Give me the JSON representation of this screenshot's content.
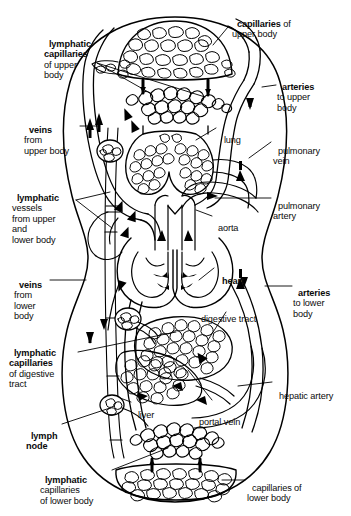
{
  "diagram": {
    "type": "anatomical-line-diagram",
    "style": {
      "stroke": "#000000",
      "fill": "#ffffff",
      "background": "#ffffff",
      "text_color": "#0b0b0b"
    },
    "labels": [
      {
        "id": "capillaries-upper-body",
        "bold": "capillaries",
        "rest": " of\nupper body",
        "x": 232,
        "y": 8,
        "align": "left"
      },
      {
        "id": "lymphatic-capillaries-upper-body",
        "bold": "lymphatic\ncapillaries",
        "rest": "\nof upper\nbody",
        "x": 44,
        "y": 28,
        "align": "left"
      },
      {
        "id": "arteries-to-upper-body",
        "bold": "arteries",
        "rest": "\nto upper\nbody",
        "x": 277,
        "y": 71,
        "align": "left"
      },
      {
        "id": "veins-from-upper-body",
        "bold": "veins",
        "rest": "\nfrom\nupper body",
        "x": 24,
        "y": 114,
        "align": "left"
      },
      {
        "id": "lung",
        "bold": "",
        "rest": "lung",
        "x": 219,
        "y": 124,
        "align": "left"
      },
      {
        "id": "pulmonary-vein",
        "bold": "",
        "rest": "pulmonary\nvein",
        "x": 273,
        "y": 135,
        "align": "left"
      },
      {
        "id": "lymphatic-vessels-upper-lower-body",
        "bold": "lymphatic",
        "rest": "\nvessels\nfrom upper\nand\nlower body",
        "x": 12,
        "y": 182,
        "align": "left"
      },
      {
        "id": "pulmonary-artery",
        "bold": "",
        "rest": "pulmonary\nartery",
        "x": 273,
        "y": 190,
        "align": "left"
      },
      {
        "id": "aorta",
        "bold": "",
        "rest": "aorta",
        "x": 213,
        "y": 212,
        "align": "left"
      },
      {
        "id": "heart",
        "bold": "heart",
        "rest": "",
        "x": 217,
        "y": 265,
        "align": "left"
      },
      {
        "id": "veins-from-lower-body",
        "bold": "veins",
        "rest": "\nfrom\nlower\nbody",
        "x": 14,
        "y": 269,
        "align": "left"
      },
      {
        "id": "arteries-to-lower-body",
        "bold": "arteries",
        "rest": "\nto lower\nbody",
        "x": 293,
        "y": 277,
        "align": "left"
      },
      {
        "id": "digestive-tract",
        "bold": "",
        "rest": "digestive tract",
        "x": 196,
        "y": 303,
        "align": "left"
      },
      {
        "id": "lymphatic-capillaries-digestive-tract",
        "bold": "lymphatic\ncapillaries",
        "rest": "\nof digestive\ntract",
        "x": 9,
        "y": 337,
        "align": "left"
      },
      {
        "id": "hepatic-artery",
        "bold": "",
        "rest": "hepatic artery",
        "x": 274,
        "y": 380,
        "align": "left"
      },
      {
        "id": "liver",
        "bold": "",
        "rest": "liver",
        "x": 133,
        "y": 399,
        "align": "left"
      },
      {
        "id": "portal-vein",
        "bold": "",
        "rest": "portal vein",
        "x": 194,
        "y": 406,
        "align": "left"
      },
      {
        "id": "lymph-node",
        "bold": "lymph\nnode",
        "rest": "",
        "x": 26,
        "y": 420,
        "align": "left"
      },
      {
        "id": "lymphatic-capillaries-lower-body",
        "bold": "lymphatic",
        "rest": "\ncapillaries\nof lower body",
        "x": 40,
        "y": 464,
        "align": "left"
      },
      {
        "id": "capillaries-of-lower-body",
        "bold": "",
        "rest": "capillaries of\nlower body",
        "x": 247,
        "y": 472,
        "align": "left"
      }
    ],
    "structures": [
      "body-outline",
      "capillary-bed-upper-body",
      "lymphatic-capillary-plexus-upper",
      "lung",
      "heart",
      "aorta",
      "pulmonary-artery",
      "pulmonary-vein",
      "vena-cava",
      "digestive-tract",
      "liver",
      "portal-vein",
      "hepatic-artery",
      "lymph-node-upper",
      "lymph-node-mid",
      "lymph-node-lower",
      "lymphatic-capillary-plexus-lower",
      "capillary-bed-lower-body",
      "flow-arrows"
    ]
  }
}
